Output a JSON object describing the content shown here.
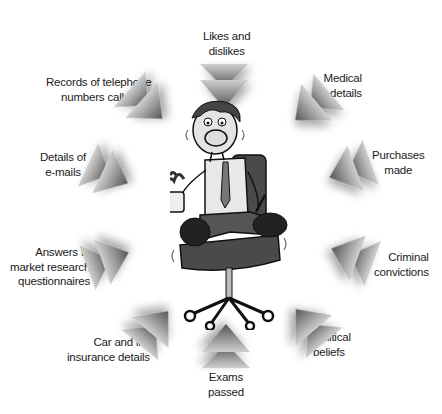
{
  "diagram": {
    "type": "hub-and-spoke",
    "center": {
      "description": "anxious cartoon man sitting on swivel office chair holding a spilling cup and a pen"
    },
    "arrow_style": "double-chevron pointing toward center",
    "items": [
      {
        "id": "likes",
        "lines": [
          "Likes and",
          "dislikes"
        ]
      },
      {
        "id": "telephone",
        "lines": [
          "Records of telephone",
          "numbers called"
        ]
      },
      {
        "id": "medical",
        "lines": [
          "Medical",
          "details"
        ]
      },
      {
        "id": "emails",
        "lines": [
          "Details of",
          "e-mails"
        ]
      },
      {
        "id": "purchases",
        "lines": [
          "Purchases",
          "made"
        ]
      },
      {
        "id": "market",
        "lines": [
          "Answers to",
          "market research",
          "questionnaires"
        ]
      },
      {
        "id": "criminal",
        "lines": [
          "Criminal",
          "convictions"
        ]
      },
      {
        "id": "insurance",
        "lines": [
          "Car and life",
          "insurance details"
        ]
      },
      {
        "id": "political",
        "lines": [
          "Political",
          "beliefs"
        ]
      },
      {
        "id": "exams",
        "lines": [
          "Exams",
          "passed"
        ]
      }
    ]
  },
  "colors": {
    "arrow_dark": "#5a5a5a",
    "arrow_light": "#d8d8d8",
    "text": "#1a1a1a"
  }
}
